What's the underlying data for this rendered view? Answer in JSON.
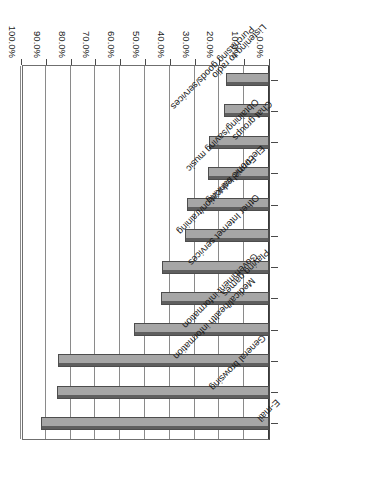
{
  "chart_data": {
    "type": "bar",
    "orientation": "horizontal",
    "title": "",
    "subtitle": "",
    "xlabel": "",
    "ylabel": "",
    "xlim": [
      0,
      100
    ],
    "grid": true,
    "legend": "none",
    "tick_labels": [
      "0.0%",
      "10.0%",
      "20.0%",
      "30.0%",
      "40.0%",
      "50.0%",
      "60.0%",
      "70.0%",
      "80.0%",
      "90.0%",
      "100.0%"
    ],
    "tick_values": [
      0,
      10,
      20,
      30,
      40,
      50,
      60,
      70,
      80,
      90,
      100
    ],
    "categories": [
      "E-mail",
      "General browsing",
      "Medical/health information",
      "Government information",
      "Playing games",
      "Other Internet services",
      "Formal education/training",
      "Electronic banking",
      "Obtaining/saving music",
      "Chat groups",
      "Purchasing goods/services",
      "Listening to radio"
    ],
    "values": [
      92.0,
      85.5,
      85.0,
      54.5,
      43.5,
      43.0,
      34.0,
      33.0,
      24.5,
      24.0,
      18.0,
      17.5
    ],
    "value_labels": [
      "92.0%",
      "85.5%",
      "85.0%",
      "54.5%",
      "43.5%",
      "43.0%",
      "34.0%",
      "33.0%",
      "24.5%",
      "24.0%",
      "18.0%",
      "17.5%"
    ],
    "series": [
      {
        "name": "Percent of users",
        "values": [
          92.0,
          85.5,
          85.0,
          54.5,
          43.5,
          43.0,
          34.0,
          33.0,
          24.5,
          24.0,
          18.0,
          17.5
        ]
      }
    ],
    "colors": {
      "bar_fill": "#a6a6a6",
      "bar_edge": "#4d4d4d",
      "bar_top": "#5f5f5f",
      "gridline": "#8a8a8a",
      "axis": "#4a4a4a",
      "background": "#ffffff",
      "text": "#1a1a1a"
    }
  }
}
